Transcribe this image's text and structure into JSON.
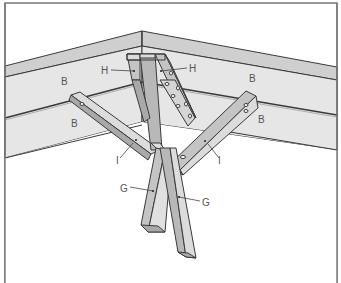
{
  "diagram": {
    "labels": {
      "B": "B",
      "H": "H",
      "I": "I",
      "G": "G"
    },
    "label_instances": [
      {
        "id": "B1",
        "text": "B",
        "x": 64,
        "y": 84
      },
      {
        "id": "B2",
        "text": "B",
        "x": 71,
        "y": 126
      },
      {
        "id": "B3",
        "text": "B",
        "x": 250,
        "y": 81
      },
      {
        "id": "B4",
        "text": "B",
        "x": 259,
        "y": 122
      },
      {
        "id": "H1",
        "text": "H",
        "x": 103,
        "y": 74
      },
      {
        "id": "H2",
        "text": "H",
        "x": 190,
        "y": 72
      },
      {
        "id": "I1",
        "text": "I",
        "x": 117,
        "y": 162
      },
      {
        "id": "I2",
        "text": "I",
        "x": 219,
        "y": 162
      },
      {
        "id": "G1",
        "text": "G",
        "x": 121,
        "y": 191
      },
      {
        "id": "G2",
        "text": "G",
        "x": 203,
        "y": 205
      }
    ],
    "colors": {
      "frame": "#777777",
      "panel": "#e6e6e6",
      "panel_top": "#cfcfcf",
      "timber_light": "#dcdcdc",
      "timber_mid": "#c4c4c4",
      "timber_dark": "#a9a9a9",
      "line": "#3a3a3a",
      "label": "#555555"
    }
  }
}
